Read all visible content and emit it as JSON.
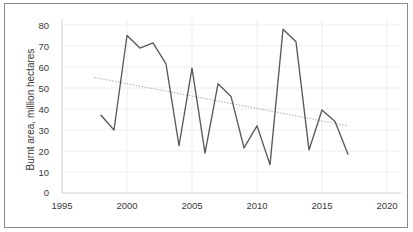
{
  "chart_data": {
    "type": "line",
    "title": "",
    "xlabel": "",
    "ylabel": "Burnt area, million hectares",
    "xlim": [
      1995,
      2020
    ],
    "ylim": [
      0,
      80
    ],
    "xticks": [
      "1995",
      "2000",
      "2005",
      "2010",
      "2015",
      "2020"
    ],
    "yticks": [
      "0",
      "10",
      "20",
      "30",
      "40",
      "50",
      "60",
      "70",
      "80"
    ],
    "grid": true,
    "legend": "none",
    "x": [
      1998,
      1999,
      2000,
      2001,
      2002,
      2003,
      2004,
      2005,
      2006,
      2007,
      2008,
      2009,
      2010,
      2011,
      2012,
      2013,
      2014,
      2015,
      2016,
      2017
    ],
    "series": [
      {
        "name": "Burnt area",
        "color": "#595959",
        "style": "solid",
        "values": [
          37,
          30,
          75,
          69,
          71.5,
          61.5,
          22.5,
          59.5,
          19,
          52,
          46,
          21.5,
          32,
          13.5,
          78,
          72,
          20.5,
          39.5,
          34,
          18.5
        ]
      },
      {
        "name": "Trendline",
        "color": "#a6a6a6",
        "style": "dotted",
        "x": [
          1997.5,
          2017
        ],
        "values": [
          55,
          32
        ]
      }
    ]
  },
  "axes": {
    "y_title": "Burnt area, million hectares",
    "y_ticks": [
      {
        "label": "80",
        "value": 80
      },
      {
        "label": "70",
        "value": 70
      },
      {
        "label": "60",
        "value": 60
      },
      {
        "label": "50",
        "value": 50
      },
      {
        "label": "40",
        "value": 40
      },
      {
        "label": "30",
        "value": 30
      },
      {
        "label": "20",
        "value": 20
      },
      {
        "label": "10",
        "value": 10
      },
      {
        "label": "0",
        "value": 0
      }
    ],
    "x_ticks": [
      {
        "label": "1995",
        "value": 1995
      },
      {
        "label": "2000",
        "value": 2000
      },
      {
        "label": "2005",
        "value": 2005
      },
      {
        "label": "2010",
        "value": 2010
      },
      {
        "label": "2015",
        "value": 2015
      },
      {
        "label": "2020",
        "value": 2020
      }
    ]
  },
  "style": {
    "frame_color": "#8a8a8a",
    "grid_color": "#ededed",
    "axis_line_color": "#d0d0d0",
    "text_color": "#3a3a3a",
    "background": "#ffffff"
  }
}
